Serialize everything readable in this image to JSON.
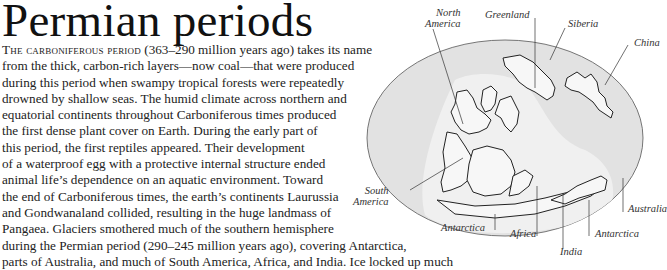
{
  "heading": {
    "title": "Permian periods"
  },
  "body": {
    "lead_small_caps": "The carboniferous period",
    "lines": [
      " (363–290 million years ago) takes its name",
      "from the thick, carbon-rich layers—now coal—that were produced",
      "during this period when swampy tropical forests were repeatedly",
      "drowned by shallow seas. The humid climate across northern and",
      "equatorial continents throughout Carboniferous times produced",
      "the first dense plant cover on Earth. During the early part of",
      "this period, the first reptiles appeared. Their development",
      "of a waterproof egg with a protective internal structure ended",
      "animal life’s dependence on an aquatic environment. Toward",
      "the end of Carboniferous times, the earth’s continents Laurussia",
      "and Gondwanaland collided, resulting in the huge landmass of",
      "Pangaea. Glaciers smothered much of the southern hemisphere",
      "during the Permian period (290–245 million years ago), covering Antarctica,",
      "parts of Australia, and much of South America, Africa, and India. Ice locked up much"
    ]
  },
  "map": {
    "ocean_color": "#e2e2e2",
    "land_color": "#f7f7f7",
    "outline_color": "#222222",
    "labels": {
      "north_america_1": "North",
      "north_america_2": "America",
      "greenland": "Greenland",
      "siberia": "Siberia",
      "china": "China",
      "south_america_1": "South",
      "south_america_2": "America",
      "antarctica_left": "Antarctica",
      "africa": "Africa",
      "india": "India",
      "antarctica_right": "Antarctica",
      "australia": "Australia"
    }
  }
}
